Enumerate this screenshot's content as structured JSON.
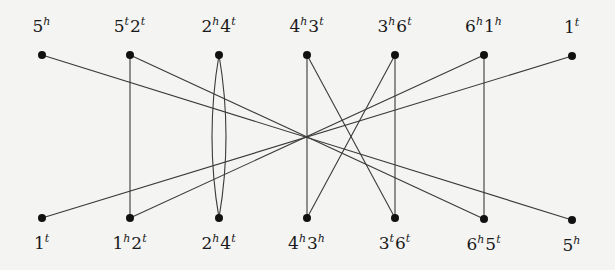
{
  "diagram": {
    "type": "graph",
    "top_row": [
      {
        "id": "T0",
        "x": 42,
        "y": 55,
        "parts": [
          {
            "base": "5",
            "sup": "h"
          }
        ]
      },
      {
        "id": "T1",
        "x": 130,
        "y": 55,
        "parts": [
          {
            "base": "5",
            "sup": "t"
          },
          {
            "base": "2",
            "sup": "t"
          }
        ]
      },
      {
        "id": "T2",
        "x": 219,
        "y": 55,
        "parts": [
          {
            "base": "2",
            "sup": "h"
          },
          {
            "base": "4",
            "sup": "t"
          }
        ]
      },
      {
        "id": "T3",
        "x": 307,
        "y": 55,
        "parts": [
          {
            "base": "4",
            "sup": "h"
          },
          {
            "base": "3",
            "sup": "t"
          }
        ]
      },
      {
        "id": "T4",
        "x": 395,
        "y": 55,
        "parts": [
          {
            "base": "3",
            "sup": "h"
          },
          {
            "base": "6",
            "sup": "t"
          }
        ]
      },
      {
        "id": "T5",
        "x": 484,
        "y": 55,
        "parts": [
          {
            "base": "6",
            "sup": "h"
          },
          {
            "base": "1",
            "sup": "h"
          }
        ]
      },
      {
        "id": "T6",
        "x": 572,
        "y": 56,
        "parts": [
          {
            "base": "1",
            "sup": "t"
          }
        ]
      }
    ],
    "bottom_row": [
      {
        "id": "B0",
        "x": 42,
        "y": 218,
        "parts": [
          {
            "base": "1",
            "sup": "t"
          }
        ]
      },
      {
        "id": "B1",
        "x": 130,
        "y": 218,
        "parts": [
          {
            "base": "1",
            "sup": "h"
          },
          {
            "base": "2",
            "sup": "t"
          }
        ]
      },
      {
        "id": "B2",
        "x": 219,
        "y": 218,
        "parts": [
          {
            "base": "2",
            "sup": "h"
          },
          {
            "base": "4",
            "sup": "t"
          }
        ]
      },
      {
        "id": "B3",
        "x": 307,
        "y": 218,
        "parts": [
          {
            "base": "4",
            "sup": "h"
          },
          {
            "base": "3",
            "sup": "h"
          }
        ]
      },
      {
        "id": "B4",
        "x": 395,
        "y": 218,
        "parts": [
          {
            "base": "3",
            "sup": "t"
          },
          {
            "base": "6",
            "sup": "t"
          }
        ]
      },
      {
        "id": "B5",
        "x": 484,
        "y": 219,
        "parts": [
          {
            "base": "6",
            "sup": "h"
          },
          {
            "base": "5",
            "sup": "t"
          }
        ]
      },
      {
        "id": "B6",
        "x": 572,
        "y": 220,
        "parts": [
          {
            "base": "5",
            "sup": "h"
          }
        ]
      }
    ],
    "straight_edges": [
      [
        "T0",
        "B6"
      ],
      [
        "T1",
        "B5"
      ],
      [
        "T6",
        "B0"
      ],
      [
        "T5",
        "B1"
      ],
      [
        "T3",
        "B4"
      ],
      [
        "T4",
        "B3"
      ],
      [
        "T1",
        "B1"
      ],
      [
        "T3",
        "B3"
      ],
      [
        "T4",
        "B4"
      ],
      [
        "T5",
        "B5"
      ]
    ],
    "curved_edges": [
      {
        "from": "T2",
        "to": "B2",
        "bulge": -14
      },
      {
        "from": "T2",
        "to": "B2",
        "bulge": 14
      }
    ],
    "colors": {
      "edge": "#3a3a3a",
      "node": "#111111",
      "label": "#1a1a1a"
    }
  }
}
